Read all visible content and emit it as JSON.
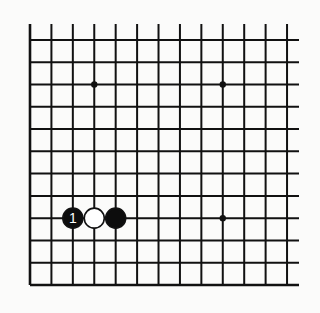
{
  "diagram": {
    "type": "go-board-fragment",
    "columns": 13,
    "rows": 12,
    "edges": {
      "left": true,
      "bottom": true,
      "top": false,
      "right": false
    },
    "colors": {
      "background": "#fbfbfa",
      "line": "#111111",
      "black_stone": "#0d0d0d",
      "white_stone": "#ffffff"
    },
    "star_points": [
      {
        "col": 3,
        "row": 2
      },
      {
        "col": 9,
        "row": 2
      },
      {
        "col": 9,
        "row": 8
      }
    ],
    "stones": [
      {
        "col": 2,
        "row": 8,
        "color": "black",
        "label": "1"
      },
      {
        "col": 3,
        "row": 8,
        "color": "white",
        "label": ""
      },
      {
        "col": 4,
        "row": 8,
        "color": "black",
        "label": ""
      }
    ]
  }
}
